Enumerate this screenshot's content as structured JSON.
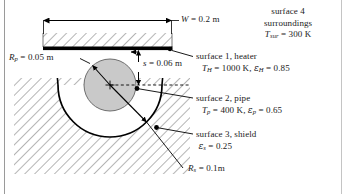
{
  "figure": {
    "kind": "engineering-diagram",
    "frame_color": "#9a9a9a",
    "pipe_fill": "#c9c9c9",
    "line_color": "#000000",
    "labels": {
      "width_dimension": {
        "sym": "W",
        "text": " = 0.2 m"
      },
      "gap_dimension": {
        "sym": "s",
        "text": " = 0.06 m"
      },
      "pipe_radius": {
        "sym": "R",
        "sub": "p",
        "text": " = 0.05 m"
      },
      "shield_radius": {
        "sym": "R",
        "sub": "s",
        "text": " = 0.1m"
      },
      "surface4": {
        "line1": "surface 4",
        "line2": "surroundings",
        "sym": "T",
        "sub": "sur",
        "text": " = 300 K"
      },
      "surface1": {
        "line1": "surface 1, heater",
        "temp_sym": "T",
        "temp_sub": "H",
        "temp_text": " = 1000 K, ",
        "emis_sym": "ε",
        "emis_sub": "H",
        "emis_text": " = 0.85"
      },
      "surface2": {
        "line1": "surface 2, pipe",
        "temp_sym": "T",
        "temp_sub": "p",
        "temp_text": " = 400 K, ",
        "emis_sym": "ε",
        "emis_sub": "p",
        "emis_text": " = 0.65"
      },
      "surface3": {
        "line1": "surface 3, shield",
        "emis_sym": "ε",
        "emis_sub": "s",
        "emis_text": " = 0.25"
      }
    }
  }
}
